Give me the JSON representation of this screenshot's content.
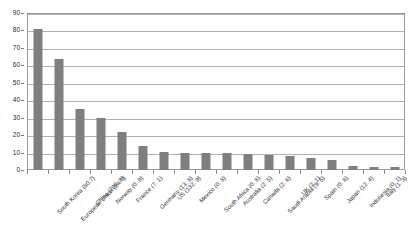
{
  "chart_data": {
    "type": "bar",
    "title": "",
    "xlabel": "",
    "ylabel": "",
    "ylim": [
      0,
      90
    ],
    "ytick_step": 10,
    "grid": true,
    "legend": "none",
    "bar_color": "#7f7f7f",
    "yticks": [
      "0",
      "10",
      "20",
      "30",
      "40",
      "50",
      "60",
      "70",
      "80",
      "90"
    ],
    "categories": [
      "South Korea (80.7)",
      "European Union (24.7)",
      "China (200. 8)",
      "Norway (0. 9)",
      "France (7. 1)",
      "Germany (13. 8)",
      "US (132. 9)",
      "Mexico (0. 8)",
      "South Africa (0. 8)",
      "Australia (2. 5)",
      "Canada (2. 6)",
      "Saudi Arabia (9. 5)",
      "UK (2. 1)",
      "Spain (0. 8)",
      "Japan (12. 4)",
      "Indonesia (0. 1)",
      "Italy (1. 3)",
      "Other EU states (1. 9)"
    ],
    "values": [
      80.7,
      63.5,
      35,
      30,
      22,
      14,
      10.5,
      10,
      9.5,
      9.5,
      9,
      8.5,
      8,
      7,
      6,
      2.5,
      1.5,
      1.5
    ]
  }
}
